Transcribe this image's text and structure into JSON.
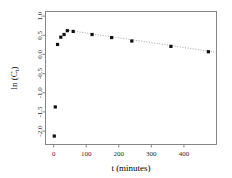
{
  "chart_data": {
    "type": "scatter",
    "title": "",
    "subtitle": "",
    "xlabel": "t (minutes)",
    "ylabel": "ln (C",
    "ylabel_subscript": "t",
    "ylabel_suffix": ")",
    "ylabel_full": "ln (Ct)",
    "xlim": [
      -25,
      500
    ],
    "ylim": [
      -2.35,
      1.12
    ],
    "xticks": [
      0,
      100,
      200,
      300,
      400
    ],
    "xtick_labels": [
      "0",
      "100",
      "200",
      "300",
      "400"
    ],
    "yticks": [
      1.0,
      0.5,
      0.0,
      -0.5,
      -1.0,
      -1.5,
      -2.0
    ],
    "ytick_labels": [
      "1.0",
      "0.5",
      "0.0",
      "-0.5",
      "-1.0",
      "-1.5",
      "-2.0"
    ],
    "grid": false,
    "legend": null,
    "legend_position": "none",
    "point_color": "#111111",
    "frame_color": "#7a7a7a",
    "fit_line_color": "#9a9a9a",
    "fit_line_style": "dotted",
    "series": [
      {
        "name": "ln (Ct)",
        "marker": "filled-square",
        "x": [
          2,
          5,
          12,
          22,
          32,
          42,
          60,
          118,
          178,
          240,
          360,
          475
        ],
        "y": [
          -2.13,
          -1.37,
          0.26,
          0.45,
          0.52,
          0.62,
          0.6,
          0.52,
          0.44,
          0.35,
          0.21,
          0.07
        ]
      }
    ],
    "annotations": [
      {
        "type": "fit-line",
        "description": "dotted regression line through decay phase",
        "x_start": 40,
        "y_start": 0.635,
        "x_end": 500,
        "y_end": 0.055
      }
    ]
  },
  "figure": {
    "width": 232,
    "height": 178,
    "background": "#ffffff"
  }
}
